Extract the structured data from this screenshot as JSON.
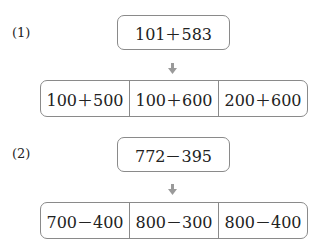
{
  "problems": [
    {
      "label": "(1)",
      "expression": "101＋583",
      "options": [
        "100＋500",
        "100＋600",
        "200＋600"
      ]
    },
    {
      "label": "(2)",
      "expression": "772－395",
      "options": [
        "700－400",
        "800－300",
        "800－400"
      ]
    }
  ],
  "colors": {
    "border": "#8a8a8a",
    "arrow": "#9a9a9a"
  }
}
